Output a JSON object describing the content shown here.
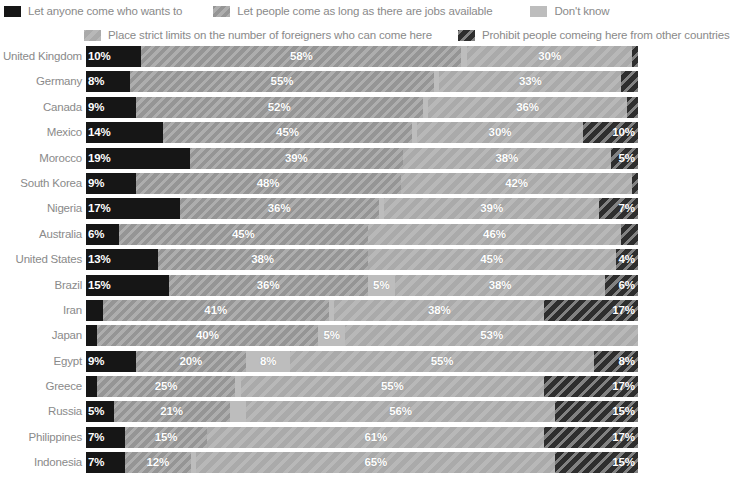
{
  "legend": {
    "rows": [
      [
        {
          "key": "anyone",
          "label": "Let anyone come who wants to",
          "color": "#161616",
          "pattern": "solid"
        },
        {
          "key": "jobs",
          "label": "Let people come as long as there are jobs available",
          "color": "#9e9e9e",
          "pattern": "diagonal-hatch"
        },
        {
          "key": "dontknow",
          "label": "Don't know",
          "color": "#bdbdbd",
          "pattern": "solid"
        }
      ],
      [
        {
          "key": "limits",
          "label": "Place strict limits on the number of foreigners who can come here",
          "color": "#b0b0b0",
          "pattern": "faint-diagonal-hatch"
        },
        {
          "key": "prohibit",
          "label": "Prohibit people comeing here from other countries",
          "color": "#2e2e2e",
          "pattern": "light-diagonal-hatch"
        }
      ]
    ]
  },
  "chart_data": {
    "type": "bar",
    "orientation": "horizontal",
    "stacked": true,
    "stack_total": 100,
    "title": "",
    "subtitle": "",
    "xlabel": "",
    "ylabel": "",
    "xlim": [
      0,
      100
    ],
    "grid": false,
    "legend_position": "top",
    "value_suffix": "%",
    "series_order": [
      "anyone",
      "jobs",
      "dontknow",
      "limits",
      "prohibit"
    ],
    "series_labels": {
      "anyone": "Let anyone come who wants to",
      "jobs": "Let people come as long as there are jobs available",
      "dontknow": "Don't know",
      "limits": "Place strict limits on the number of foreigners who can come here",
      "prohibit": "Prohibit people comeing here from other countries"
    },
    "categories": [
      "United Kingdom",
      "Germany",
      "Canada",
      "Mexico",
      "Morocco",
      "South Korea",
      "Nigeria",
      "Australia",
      "United States",
      "Brazil",
      "Iran",
      "Japan",
      "Egypt",
      "Greece",
      "Russia",
      "Philippines",
      "Indonesia"
    ],
    "rows": [
      {
        "category": "United Kingdom",
        "segments": [
          {
            "key": "anyone",
            "value": 10,
            "label": "10%"
          },
          {
            "key": "jobs",
            "value": 58,
            "label": "58%"
          },
          {
            "key": "dontknow",
            "value": 1,
            "label": ""
          },
          {
            "key": "limits",
            "value": 30,
            "label": "30%"
          },
          {
            "key": "prohibit",
            "value": 1,
            "label": ""
          }
        ]
      },
      {
        "category": "Germany",
        "segments": [
          {
            "key": "anyone",
            "value": 8,
            "label": "8%"
          },
          {
            "key": "jobs",
            "value": 55,
            "label": "55%"
          },
          {
            "key": "dontknow",
            "value": 1,
            "label": ""
          },
          {
            "key": "limits",
            "value": 33,
            "label": "33%"
          },
          {
            "key": "prohibit",
            "value": 3,
            "label": ""
          }
        ]
      },
      {
        "category": "Canada",
        "segments": [
          {
            "key": "anyone",
            "value": 9,
            "label": "9%"
          },
          {
            "key": "jobs",
            "value": 52,
            "label": "52%"
          },
          {
            "key": "dontknow",
            "value": 1,
            "label": ""
          },
          {
            "key": "limits",
            "value": 36,
            "label": "36%"
          },
          {
            "key": "prohibit",
            "value": 2,
            "label": ""
          }
        ]
      },
      {
        "category": "Mexico",
        "segments": [
          {
            "key": "anyone",
            "value": 14,
            "label": "14%"
          },
          {
            "key": "jobs",
            "value": 45,
            "label": "45%"
          },
          {
            "key": "dontknow",
            "value": 1,
            "label": ""
          },
          {
            "key": "limits",
            "value": 30,
            "label": "30%"
          },
          {
            "key": "prohibit",
            "value": 10,
            "label": "10%"
          }
        ]
      },
      {
        "category": "Morocco",
        "segments": [
          {
            "key": "anyone",
            "value": 19,
            "label": "19%"
          },
          {
            "key": "jobs",
            "value": 39,
            "label": "39%"
          },
          {
            "key": "dontknow",
            "value": 0,
            "label": ""
          },
          {
            "key": "limits",
            "value": 38,
            "label": "38%"
          },
          {
            "key": "prohibit",
            "value": 5,
            "label": "5%"
          }
        ]
      },
      {
        "category": "South Korea",
        "segments": [
          {
            "key": "anyone",
            "value": 9,
            "label": "9%"
          },
          {
            "key": "jobs",
            "value": 48,
            "label": "48%"
          },
          {
            "key": "dontknow",
            "value": 0,
            "label": ""
          },
          {
            "key": "limits",
            "value": 42,
            "label": "42%"
          },
          {
            "key": "prohibit",
            "value": 1,
            "label": ""
          }
        ]
      },
      {
        "category": "Nigeria",
        "segments": [
          {
            "key": "anyone",
            "value": 17,
            "label": "17%"
          },
          {
            "key": "jobs",
            "value": 36,
            "label": "36%"
          },
          {
            "key": "dontknow",
            "value": 1,
            "label": ""
          },
          {
            "key": "limits",
            "value": 39,
            "label": "39%"
          },
          {
            "key": "prohibit",
            "value": 7,
            "label": "7%"
          }
        ]
      },
      {
        "category": "Australia",
        "segments": [
          {
            "key": "anyone",
            "value": 6,
            "label": "6%"
          },
          {
            "key": "jobs",
            "value": 45,
            "label": "45%"
          },
          {
            "key": "dontknow",
            "value": 0,
            "label": ""
          },
          {
            "key": "limits",
            "value": 46,
            "label": "46%"
          },
          {
            "key": "prohibit",
            "value": 3,
            "label": ""
          }
        ]
      },
      {
        "category": "United States",
        "segments": [
          {
            "key": "anyone",
            "value": 13,
            "label": "13%"
          },
          {
            "key": "jobs",
            "value": 38,
            "label": "38%"
          },
          {
            "key": "dontknow",
            "value": 0,
            "label": ""
          },
          {
            "key": "limits",
            "value": 45,
            "label": "45%"
          },
          {
            "key": "prohibit",
            "value": 4,
            "label": "4%"
          }
        ]
      },
      {
        "category": "Brazil",
        "segments": [
          {
            "key": "anyone",
            "value": 15,
            "label": "15%"
          },
          {
            "key": "jobs",
            "value": 36,
            "label": "36%"
          },
          {
            "key": "dontknow",
            "value": 5,
            "label": "5%"
          },
          {
            "key": "limits",
            "value": 38,
            "label": "38%"
          },
          {
            "key": "prohibit",
            "value": 6,
            "label": "6%"
          }
        ]
      },
      {
        "category": "Iran",
        "segments": [
          {
            "key": "anyone",
            "value": 3,
            "label": ""
          },
          {
            "key": "jobs",
            "value": 41,
            "label": "41%"
          },
          {
            "key": "dontknow",
            "value": 1,
            "label": ""
          },
          {
            "key": "limits",
            "value": 38,
            "label": "38%"
          },
          {
            "key": "prohibit",
            "value": 17,
            "label": "17%"
          }
        ]
      },
      {
        "category": "Japan",
        "segments": [
          {
            "key": "anyone",
            "value": 2,
            "label": ""
          },
          {
            "key": "jobs",
            "value": 40,
            "label": "40%"
          },
          {
            "key": "dontknow",
            "value": 5,
            "label": "5%"
          },
          {
            "key": "limits",
            "value": 53,
            "label": "53%"
          },
          {
            "key": "prohibit",
            "value": 0,
            "label": ""
          }
        ]
      },
      {
        "category": "Egypt",
        "segments": [
          {
            "key": "anyone",
            "value": 9,
            "label": "9%"
          },
          {
            "key": "jobs",
            "value": 20,
            "label": "20%"
          },
          {
            "key": "dontknow",
            "value": 8,
            "label": "8%"
          },
          {
            "key": "limits",
            "value": 55,
            "label": "55%"
          },
          {
            "key": "prohibit",
            "value": 8,
            "label": "8%"
          }
        ]
      },
      {
        "category": "Greece",
        "segments": [
          {
            "key": "anyone",
            "value": 2,
            "label": ""
          },
          {
            "key": "jobs",
            "value": 25,
            "label": "25%"
          },
          {
            "key": "dontknow",
            "value": 1,
            "label": ""
          },
          {
            "key": "limits",
            "value": 55,
            "label": "55%"
          },
          {
            "key": "prohibit",
            "value": 17,
            "label": "17%"
          }
        ]
      },
      {
        "category": "Russia",
        "segments": [
          {
            "key": "anyone",
            "value": 5,
            "label": "5%"
          },
          {
            "key": "jobs",
            "value": 21,
            "label": "21%"
          },
          {
            "key": "dontknow",
            "value": 3,
            "label": ""
          },
          {
            "key": "limits",
            "value": 56,
            "label": "56%"
          },
          {
            "key": "prohibit",
            "value": 15,
            "label": "15%"
          }
        ]
      },
      {
        "category": "Philippines",
        "segments": [
          {
            "key": "anyone",
            "value": 7,
            "label": "7%"
          },
          {
            "key": "jobs",
            "value": 15,
            "label": "15%"
          },
          {
            "key": "dontknow",
            "value": 0,
            "label": ""
          },
          {
            "key": "limits",
            "value": 61,
            "label": "61%"
          },
          {
            "key": "prohibit",
            "value": 17,
            "label": "17%"
          }
        ]
      },
      {
        "category": "Indonesia",
        "segments": [
          {
            "key": "anyone",
            "value": 7,
            "label": "7%"
          },
          {
            "key": "jobs",
            "value": 12,
            "label": "12%"
          },
          {
            "key": "dontknow",
            "value": 1,
            "label": ""
          },
          {
            "key": "limits",
            "value": 65,
            "label": "65%"
          },
          {
            "key": "prohibit",
            "value": 15,
            "label": "15%"
          }
        ]
      }
    ]
  }
}
